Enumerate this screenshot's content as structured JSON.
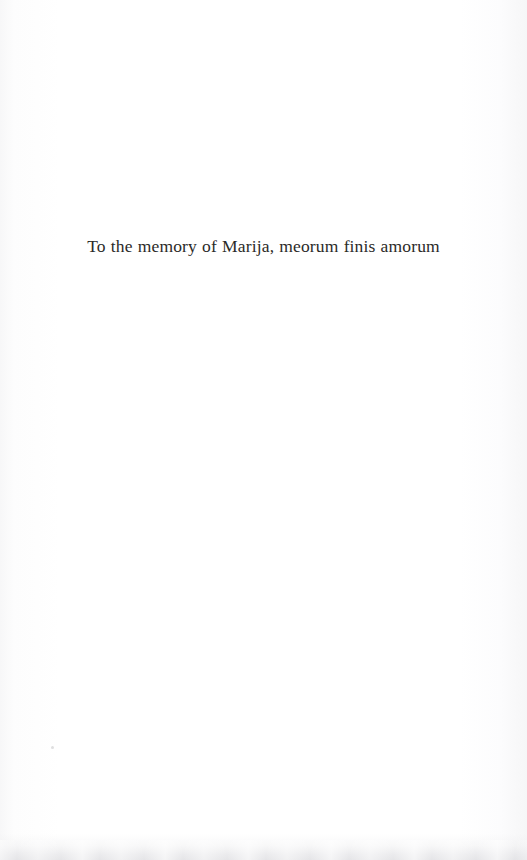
{
  "page": {
    "kind": "book-dedication-page",
    "background_color": "#fefefe",
    "ink_color": "#2b2a28",
    "width": 527,
    "height": 860
  },
  "dedication": {
    "text": "To the memory of Marija, meorum finis amorum"
  },
  "artifacts": {
    "bottom_edge_shadow_color": "#e9e9eb",
    "dust_speck_color": "#c4c4c6"
  }
}
